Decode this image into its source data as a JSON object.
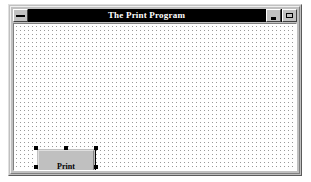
{
  "window": {
    "title": "The Print Program",
    "sysmenu_icon": "system-menu-icon",
    "minimize_icon": "minimize-icon",
    "maximize_icon": "maximize-icon",
    "background_color": "#c0c0c0",
    "titlebar_color": "#000000",
    "titlebar_text_color": "#ffffff"
  },
  "form": {
    "background_color": "#ffffff",
    "grid_dot_color": "#9a9a9a",
    "grid_spacing_px": 4
  },
  "controls": {
    "print_button": {
      "label": "Print",
      "accelerator": "P",
      "label_rest": "rint",
      "selected": true,
      "handle_color": "#000000"
    },
    "exit_button": {
      "label": "Exit",
      "accelerator": "E",
      "label_rest": "xit",
      "selected": false
    }
  }
}
